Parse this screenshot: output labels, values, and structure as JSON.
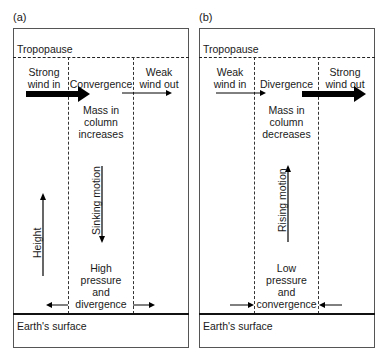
{
  "panels": [
    {
      "id": "a",
      "label": "(a)",
      "tropopause_label": "Tropopause",
      "inflow_label": [
        "Strong",
        "wind in"
      ],
      "process_label": "Convergence",
      "outflow_label": [
        "Weak",
        "wind out"
      ],
      "mass_label": [
        "Mass in",
        "column",
        "increases"
      ],
      "vertical_motion_label": "Sinking motion",
      "vertical_motion_direction": "down",
      "height_label": "Height",
      "surface_label": [
        "High",
        "pressure",
        "and",
        "divergence"
      ],
      "surface_flow": "outward",
      "earth_label": "Earth's surface"
    },
    {
      "id": "b",
      "label": "(b)",
      "tropopause_label": "Tropopause",
      "inflow_label": [
        "Weak",
        "wind in"
      ],
      "process_label": "Divergence",
      "outflow_label": [
        "Strong",
        "wind out"
      ],
      "mass_label": [
        "Mass in",
        "column",
        "decreases"
      ],
      "vertical_motion_label": "Rising motion",
      "vertical_motion_direction": "up",
      "surface_label": [
        "Low",
        "pressure",
        "and",
        "convergence"
      ],
      "surface_flow": "inward",
      "earth_label": "Earth's surface"
    }
  ]
}
